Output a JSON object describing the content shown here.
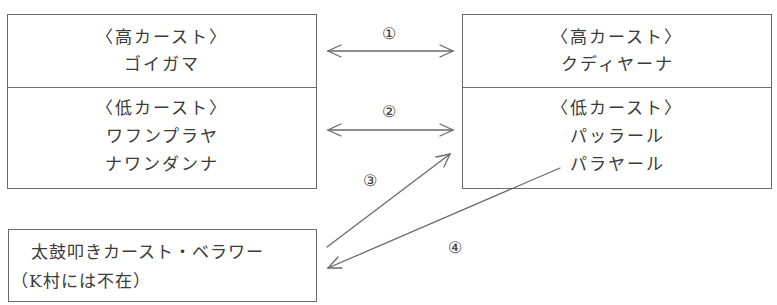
{
  "left_box": {
    "high_caste": {
      "heading": "〈高カースト〉",
      "members": [
        "ゴイガマ"
      ]
    },
    "low_caste": {
      "heading": "〈低カースト〉",
      "members": [
        "ワフンプラヤ",
        "ナワンダンナ"
      ]
    }
  },
  "right_box": {
    "high_caste": {
      "heading": "〈高カースト〉",
      "members": [
        "クディヤーナ"
      ]
    },
    "low_caste": {
      "heading": "〈低カースト〉",
      "members": [
        "パッラール",
        "パラヤール"
      ]
    }
  },
  "bottom_box": {
    "line1": "太鼓叩きカースト・ベラワー",
    "line2": "（K村には不在）"
  },
  "arrows": [
    {
      "label": "①",
      "type": "bidirectional",
      "from": "left_box.high_caste",
      "to": "right_box.high_caste"
    },
    {
      "label": "②",
      "type": "bidirectional",
      "from": "left_box.low_caste",
      "to": "right_box.low_caste"
    },
    {
      "label": "③",
      "type": "unidirectional",
      "from": "bottom_box",
      "to": "right_box.low_caste"
    },
    {
      "label": "④",
      "type": "unidirectional",
      "from": "right_box.low_caste.パラヤール",
      "to": "bottom_box"
    }
  ],
  "colors": {
    "line": "#6a6a6a",
    "text": "#3a3a3a"
  }
}
